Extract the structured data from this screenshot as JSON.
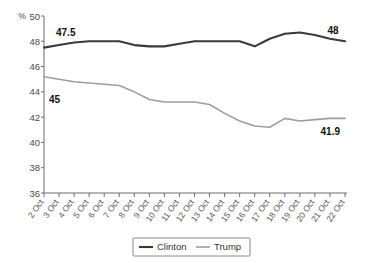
{
  "chart_data": {
    "type": "line",
    "title": "",
    "xlabel": "",
    "ylabel": "%",
    "unit_label": "%",
    "ylim": [
      36,
      50
    ],
    "yticks": [
      36,
      38,
      40,
      42,
      44,
      46,
      48,
      50
    ],
    "ytick_labels": [
      "36",
      "38",
      "40",
      "42",
      "44",
      "46",
      "48",
      "50"
    ],
    "grid": false,
    "legend_position": "bottom-center",
    "categories": [
      "2 Oct",
      "3 Oct",
      "4 Oct",
      "5 Oct",
      "6 Oct",
      "7 Oct",
      "8 Oct",
      "9 Oct",
      "10 Oct",
      "11 Oct",
      "12 Oct",
      "13 Oct",
      "14 Oct",
      "15 Oct",
      "16 Oct",
      "17 Oct",
      "18 Oct",
      "19 Oct",
      "20 Oct",
      "21 Oct",
      "22 Oct"
    ],
    "series": [
      {
        "name": "Clinton",
        "color": "#3a3a3a",
        "values": [
          47.5,
          47.7,
          47.9,
          48.0,
          48.0,
          48.0,
          47.7,
          47.6,
          47.6,
          47.8,
          48.0,
          48.0,
          48.0,
          48.0,
          47.6,
          48.2,
          48.6,
          48.7,
          48.5,
          48.2,
          48.0
        ],
        "start_label": "47.5",
        "end_label": "48"
      },
      {
        "name": "Trump",
        "color": "#9e9e9e",
        "values": [
          45.2,
          45.0,
          44.8,
          44.7,
          44.6,
          44.5,
          44.0,
          43.4,
          43.2,
          43.2,
          43.2,
          43.0,
          42.3,
          41.7,
          41.3,
          41.2,
          41.9,
          41.7,
          41.8,
          41.9,
          41.9
        ],
        "start_label": "45",
        "end_label": "41.9"
      }
    ],
    "annotations": [
      {
        "text": "47.5",
        "series": "Clinton",
        "position": "start"
      },
      {
        "text": "48",
        "series": "Clinton",
        "position": "end"
      },
      {
        "text": "45",
        "series": "Trump",
        "position": "start"
      },
      {
        "text": "41.9",
        "series": "Trump",
        "position": "end"
      }
    ],
    "legend": [
      {
        "label": "Clinton",
        "color": "#3a3a3a"
      },
      {
        "label": "Trump",
        "color": "#9e9e9e"
      }
    ]
  }
}
